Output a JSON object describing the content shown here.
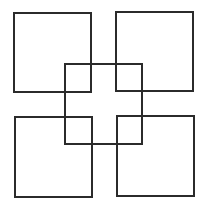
{
  "diagram": {
    "background": "#ffffff",
    "stroke_color": "#2b2b2b",
    "stroke_width": 2,
    "shapes": [
      {
        "id": "top-left",
        "type": "square",
        "x": 14,
        "y": 13,
        "width": 77,
        "height": 79
      },
      {
        "id": "top-right",
        "type": "square",
        "x": 116,
        "y": 12,
        "width": 77,
        "height": 79
      },
      {
        "id": "bottom-left",
        "type": "square",
        "x": 15,
        "y": 117,
        "width": 77,
        "height": 80
      },
      {
        "id": "bottom-right",
        "type": "square",
        "x": 117,
        "y": 116,
        "width": 77,
        "height": 80
      },
      {
        "id": "center",
        "type": "square",
        "x": 65,
        "y": 64,
        "width": 77,
        "height": 80
      }
    ]
  }
}
